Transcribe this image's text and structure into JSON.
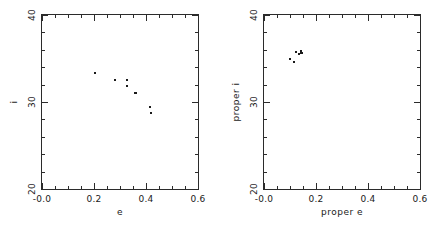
{
  "figure": {
    "background": "#ffffff",
    "ink": "#2b2b2b",
    "panel_count": 2
  },
  "chart_data": [
    {
      "type": "scatter",
      "panel": "left",
      "title": "",
      "xlabel": "e",
      "ylabel": "i",
      "xlim": [
        0.0,
        0.6
      ],
      "ylim": [
        20,
        40
      ],
      "xticks": [
        0.0,
        0.2,
        0.4,
        0.6
      ],
      "xticklabels": [
        "-0.0",
        "0.2",
        "0.4",
        "0.6"
      ],
      "yticks": [
        20,
        30,
        40
      ],
      "yticklabels": [
        "20",
        "30",
        "40"
      ],
      "xminor_step": 0.05,
      "yminor_step": 2,
      "grid": false,
      "legend": null,
      "tick_direction": "in",
      "points": [
        {
          "x": 0.2,
          "y": 33.5
        },
        {
          "x": 0.277,
          "y": 32.6
        },
        {
          "x": 0.322,
          "y": 32.6
        },
        {
          "x": 0.323,
          "y": 31.9
        },
        {
          "x": 0.352,
          "y": 31.2
        },
        {
          "x": 0.356,
          "y": 31.1
        },
        {
          "x": 0.412,
          "y": 29.5
        },
        {
          "x": 0.417,
          "y": 28.9
        }
      ]
    },
    {
      "type": "scatter",
      "panel": "right",
      "title": "",
      "xlabel": "proper e",
      "ylabel": "proper i",
      "xlim": [
        0.0,
        0.6
      ],
      "ylim": [
        20,
        40
      ],
      "xticks": [
        0.0,
        0.2,
        0.4,
        0.6
      ],
      "xticklabels": [
        "-0.0",
        "0.2",
        "0.4",
        "0.6"
      ],
      "yticks": [
        20,
        30,
        40
      ],
      "yticklabels": [
        "20",
        "30",
        "40"
      ],
      "xminor_step": 0.05,
      "yminor_step": 2,
      "grid": false,
      "legend": null,
      "tick_direction": "in",
      "points": [
        {
          "x": 0.097,
          "y": 35.1
        },
        {
          "x": 0.121,
          "y": 35.9
        },
        {
          "x": 0.131,
          "y": 35.6
        },
        {
          "x": 0.137,
          "y": 36.0
        },
        {
          "x": 0.14,
          "y": 35.7
        },
        {
          "x": 0.143,
          "y": 35.8
        },
        {
          "x": 0.112,
          "y": 34.7
        }
      ]
    }
  ]
}
